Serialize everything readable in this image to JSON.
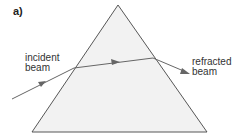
{
  "panel_label": "a)",
  "labels": {
    "incident": [
      "incident",
      "beam"
    ],
    "refracted": [
      "refracted",
      "beam"
    ]
  },
  "colors": {
    "prism_fill": "#f2f2f2",
    "prism_stroke": "#444444",
    "beam": "#666666",
    "text": "#333333"
  },
  "shapes": {
    "prism": "triangular prism",
    "beam_path": [
      "incident beam",
      "beam inside prism",
      "refracted beam"
    ]
  }
}
